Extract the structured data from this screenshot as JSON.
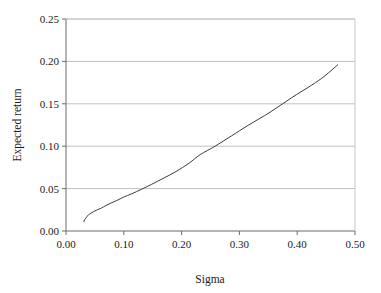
{
  "chart_data": {
    "type": "line",
    "title": "",
    "subtitle": "",
    "xlabel": "Sigma",
    "ylabel": "Expected return",
    "xlim": [
      0.0,
      0.5
    ],
    "ylim": [
      0.0,
      0.25
    ],
    "xticks": [
      "0.00",
      "0.10",
      "0.20",
      "0.30",
      "0.40",
      "0.50"
    ],
    "xtick_values": [
      0.0,
      0.1,
      0.2,
      0.3,
      0.4,
      0.5
    ],
    "yticks": [
      "0.00",
      "0.05",
      "0.10",
      "0.15",
      "0.20",
      "0.25"
    ],
    "ytick_values": [
      0.0,
      0.05,
      0.1,
      0.15,
      0.2,
      0.25
    ],
    "grid": "horizontal",
    "legend": "none",
    "annotations": [],
    "series": [
      {
        "name": "efficient-frontier",
        "color": "#3c3c3c",
        "line_width": 1,
        "x": [
          0.031,
          0.032,
          0.034,
          0.036,
          0.039,
          0.043,
          0.048,
          0.054,
          0.061,
          0.069,
          0.078,
          0.088,
          0.1,
          0.114,
          0.13,
          0.148,
          0.168,
          0.19,
          0.213,
          0.232,
          0.258,
          0.286,
          0.316,
          0.353,
          0.39,
          0.425,
          0.448,
          0.47
        ],
        "y": [
          0.011,
          0.013,
          0.015,
          0.017,
          0.019,
          0.021,
          0.023,
          0.025,
          0.027,
          0.03,
          0.033,
          0.036,
          0.04,
          0.044,
          0.049,
          0.055,
          0.062,
          0.07,
          0.08,
          0.09,
          0.1,
          0.112,
          0.125,
          0.14,
          0.157,
          0.172,
          0.183,
          0.196
        ]
      }
    ]
  },
  "axes": {
    "x_title": "Sigma",
    "y_title": "Expected return"
  }
}
